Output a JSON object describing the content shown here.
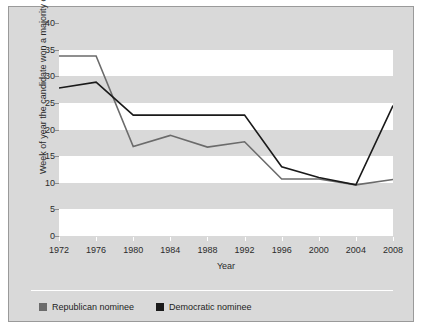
{
  "chart_data": {
    "type": "line",
    "title": "",
    "xlabel": "Year",
    "ylabel": "Week of year the candidate won a majority of delegates",
    "x": [
      1972,
      1976,
      1980,
      1984,
      1988,
      1992,
      1996,
      2000,
      2004,
      2008
    ],
    "xtick_labels": [
      "1972",
      "1976",
      "1980",
      "1984",
      "1988",
      "1992",
      "1996",
      "2000",
      "2004",
      "2008"
    ],
    "ytick_labels": [
      "0",
      "5",
      "10",
      "15",
      "20",
      "25",
      "30",
      "35",
      "40"
    ],
    "yticks": [
      0,
      5,
      10,
      15,
      20,
      25,
      30,
      35,
      40
    ],
    "ylim": [
      0,
      40
    ],
    "xlim": [
      1972,
      2008
    ],
    "grid": false,
    "banded_background": true,
    "legend_position": "below",
    "series": [
      {
        "name": "Republican nominee",
        "color": "#6b6b6b",
        "values": [
          33.8,
          33.8,
          16.8,
          18.9,
          16.7,
          17.7,
          10.7,
          10.7,
          9.6,
          10.6
        ]
      },
      {
        "name": "Democratic nominee",
        "color": "#1a1a1a",
        "values": [
          27.8,
          28.9,
          22.7,
          22.7,
          22.7,
          22.7,
          13.0,
          11.0,
          9.6,
          24.5
        ]
      }
    ]
  },
  "legend": {
    "entries": [
      {
        "label": "Republican nominee",
        "color": "#6b6b6b"
      },
      {
        "label": "Democratic nominee",
        "color": "#1a1a1a"
      }
    ]
  },
  "colors": {
    "panel_background": "#d9d9d9",
    "band_white": "#ffffff",
    "republican": "#6b6b6b",
    "democratic": "#1a1a1a",
    "text": "#2b2b2b"
  }
}
